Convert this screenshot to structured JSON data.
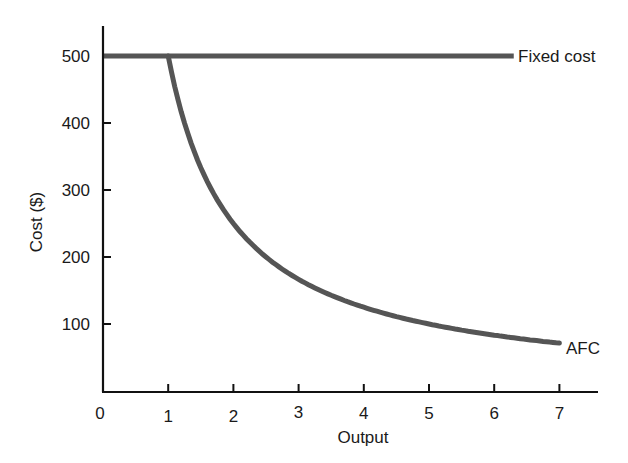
{
  "chart_data": {
    "type": "line",
    "title": "",
    "xlabel": "Output",
    "ylabel": "Cost ($)",
    "xlim": [
      0,
      7.5
    ],
    "ylim": [
      0,
      540
    ],
    "grid": false,
    "legend_position": "inline-labels",
    "x_ticks": [
      "0",
      "1",
      "2",
      "3",
      "4",
      "5",
      "6",
      "7"
    ],
    "y_ticks": [
      "100",
      "200",
      "300",
      "400",
      "500"
    ],
    "series": [
      {
        "name": "Fixed cost",
        "color": "#555555",
        "x": [
          0,
          6.3
        ],
        "values": [
          500,
          500
        ]
      },
      {
        "name": "AFC",
        "color": "#555555",
        "x": [
          1,
          1.5,
          2,
          2.5,
          3,
          3.5,
          4,
          4.5,
          5,
          5.5,
          6,
          6.5,
          7
        ],
        "values": [
          500,
          333,
          250,
          200,
          167,
          143,
          125,
          111,
          100,
          91,
          83,
          77,
          71
        ]
      }
    ],
    "annotations": [
      {
        "text": "Fixed cost",
        "at_x": 6.3,
        "at_y": 500
      },
      {
        "text": "AFC",
        "at_x": 7,
        "at_y": 71
      }
    ]
  }
}
